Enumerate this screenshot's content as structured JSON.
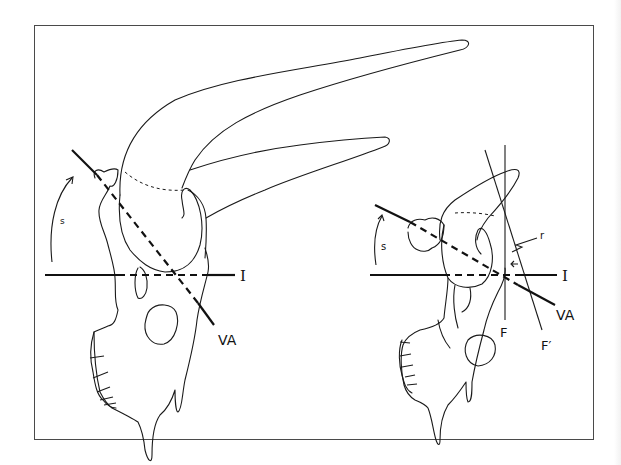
{
  "figure": {
    "left_panel": {
      "labels": {
        "rotation": "s",
        "horizontal_axis": "I",
        "vertical_axis": "VA"
      }
    },
    "right_panel": {
      "labels": {
        "rotation": "s",
        "horizontal_axis": "I",
        "vertical_axis": "VA",
        "frontal_line": "F",
        "frontal_line_prime": "F′",
        "r_marker": "r"
      }
    },
    "colors": {
      "line": "#111111",
      "frame": "#4a4a4a",
      "background": "#ffffff"
    }
  }
}
